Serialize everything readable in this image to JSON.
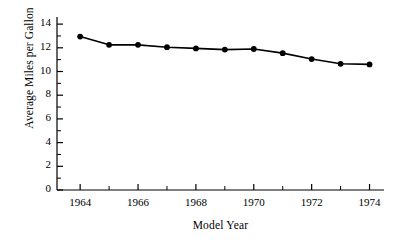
{
  "chart_data": {
    "type": "line",
    "title": "",
    "xlabel": "Model Year",
    "ylabel": "Average Miles per Gallon",
    "x": [
      1964,
      1965,
      1966,
      1967,
      1968,
      1969,
      1970,
      1971,
      1972,
      1973,
      1974
    ],
    "values": [
      12.95,
      12.25,
      12.25,
      12.05,
      11.95,
      11.85,
      11.9,
      11.55,
      11.05,
      10.65,
      10.6
    ],
    "series": [
      {
        "name": "Average Miles per Gallon",
        "values": [
          12.95,
          12.25,
          12.25,
          12.05,
          11.95,
          11.85,
          11.9,
          11.55,
          11.05,
          10.65,
          10.6
        ]
      }
    ],
    "xlim": [
      1963.2,
      1974.5
    ],
    "ylim": [
      0,
      14.6
    ],
    "x_major_ticks": [
      1964,
      1966,
      1968,
      1970,
      1972,
      1974
    ],
    "x_minor_ticks": [
      1965,
      1967,
      1969,
      1971,
      1973
    ],
    "x_tick_labels": [
      "1964",
      "1966",
      "1968",
      "1970",
      "1972",
      "1974"
    ],
    "y_major_ticks": [
      0,
      2,
      4,
      6,
      8,
      10,
      12,
      14
    ],
    "y_minor_ticks": [
      1,
      3,
      5,
      7,
      9,
      11,
      13
    ],
    "y_tick_labels": [
      "0",
      "2",
      "4",
      "6",
      "8",
      "10",
      "12",
      "14"
    ],
    "grid": false,
    "legend": false,
    "marker": "filled-circle",
    "line_color": "#000000",
    "marker_color": "#000000",
    "background_color": "#ffffff"
  }
}
